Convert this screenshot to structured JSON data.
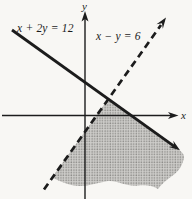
{
  "figure": {
    "type": "linear-inequality-graph",
    "x_axis_label": "x",
    "y_axis_label": "y",
    "lines": [
      {
        "label": "x + 2y = 12",
        "style": "solid",
        "direction": "falls left-to-right, arrow at lower right"
      },
      {
        "label": "x − y = 6",
        "style": "dashed",
        "direction": "rises left-to-right, arrow at upper right"
      }
    ],
    "shaded_region": "stippled gray region to the right of the dashed line and below the solid line, lower edge wavy (region continues off-figure)",
    "colors": {
      "ink": "#1c1c1c",
      "paper": "#f8f7f4",
      "shade_base": "#cfcecb",
      "shade_dot": "#8e8d8a"
    }
  }
}
